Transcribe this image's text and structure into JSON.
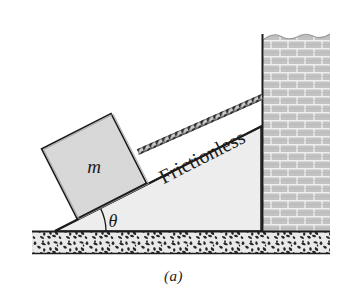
{
  "figure": {
    "caption": "(a)",
    "background_color": "#ffffff",
    "width": 347,
    "height": 299
  },
  "labels": {
    "block_mass": "m",
    "incline_surface": "Frictionless",
    "angle": "θ"
  },
  "colors": {
    "ink": "#1c1c1c",
    "incline_fill": "#ededed",
    "block_fill": "#d8d8d8",
    "wall_fill": "#c2c2c2",
    "wall_mortar": "#ffffff",
    "ground_fill": "#e8e8e8",
    "ground_speckle": "#2a2a2a",
    "rope_dark": "#3a3a3a",
    "rope_light": "#bdbdbd"
  },
  "geometry": {
    "incline_angle_deg": 27,
    "incline_apex": {
      "x": 55,
      "y": 231
    },
    "incline_top": {
      "x": 262,
      "y": 126
    },
    "incline_base_right": {
      "x": 262,
      "y": 231
    },
    "ground_band": {
      "x": 32,
      "y": 231,
      "width": 298,
      "height": 23
    },
    "wall": {
      "x": 262,
      "y": 30,
      "width": 68,
      "height": 201
    },
    "block": {
      "center_x": 94,
      "center_y": 166,
      "size": 78,
      "rotation_deg": -27
    },
    "rope_start": {
      "x": 138,
      "y": 152
    },
    "rope_end": {
      "x": 262,
      "y": 97
    }
  },
  "icons": {
    "rope": "braided-cord-icon",
    "wall": "brick-wall-icon",
    "ground": "stippled-ground-icon",
    "break": "torn-edge-icon"
  }
}
